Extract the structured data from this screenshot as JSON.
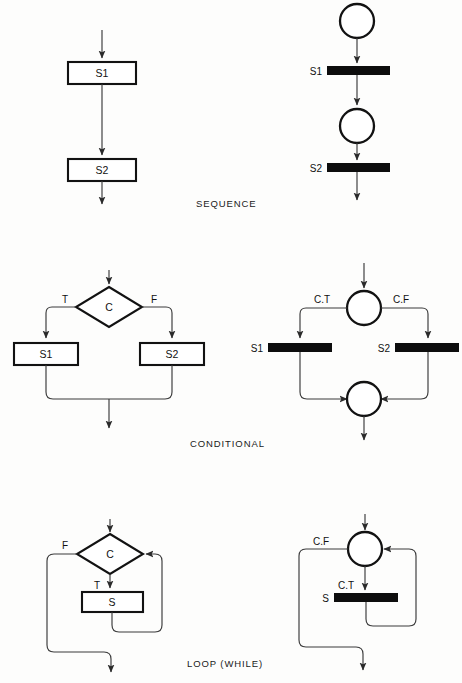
{
  "figure": {
    "background_color": "#fdfdfc",
    "line_color": "#3a3a3a",
    "shape_stroke_color": "#121212",
    "transition_fill": "#0d0d0d"
  },
  "captions": {
    "sequence": "SEQUENCE",
    "conditional": "CONDITIONAL",
    "loop": "LOOP (WHILE)"
  },
  "sections": [
    {
      "id": "sequence",
      "caption": "SEQUENCE",
      "flowchart": {
        "boxes": [
          {
            "label": "S1"
          },
          {
            "label": "S2"
          }
        ]
      },
      "petrinet": {
        "places": 2,
        "transitions": [
          {
            "label": "S1"
          },
          {
            "label": "S2"
          }
        ]
      }
    },
    {
      "id": "conditional",
      "caption": "CONDITIONAL",
      "flowchart": {
        "decision": {
          "label": "C"
        },
        "branch_labels": {
          "true": "T",
          "false": "F"
        },
        "boxes": [
          {
            "label": "S1"
          },
          {
            "label": "S2"
          }
        ]
      },
      "petrinet": {
        "places": 2,
        "arc_labels": {
          "true": "C.T",
          "false": "C.F"
        },
        "transitions": [
          {
            "label": "S1"
          },
          {
            "label": "S2"
          }
        ]
      }
    },
    {
      "id": "loop",
      "caption": "LOOP (WHILE)",
      "flowchart": {
        "decision": {
          "label": "C"
        },
        "branch_labels": {
          "true": "T",
          "false": "F"
        },
        "boxes": [
          {
            "label": "S"
          }
        ]
      },
      "petrinet": {
        "places": 1,
        "arc_labels": {
          "true": "C.T",
          "false": "C.F"
        },
        "transitions": [
          {
            "label": "S"
          }
        ]
      }
    }
  ]
}
